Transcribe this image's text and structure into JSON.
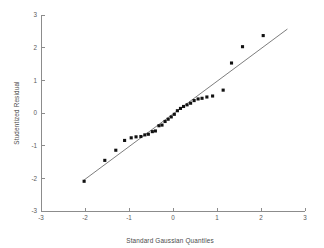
{
  "chart_data": {
    "type": "scatter",
    "title": "",
    "xlabel": "Standard Gaussian Quantiles",
    "ylabel": "Studentized Residual",
    "xlim": [
      -3,
      3
    ],
    "ylim": [
      -3,
      3
    ],
    "xticks": [
      -3,
      -2,
      -1,
      0,
      1,
      2,
      3
    ],
    "yticks": [
      -3,
      -2,
      -1,
      0,
      1,
      2,
      3
    ],
    "xtick_labels": [
      "-3",
      "-2",
      "-1",
      "0",
      "1",
      "2",
      "3"
    ],
    "ytick_labels": [
      "-3",
      "-2",
      "-1",
      "0",
      "1",
      "2",
      "3"
    ],
    "grid": false,
    "legend": "none",
    "annotations": [],
    "series": [
      {
        "name": "Studentized residuals",
        "marker": "filled-square",
        "marker_color": "#111111",
        "x": [
          -2.02,
          -1.55,
          -1.3,
          -1.1,
          -0.95,
          -0.84,
          -0.73,
          -0.64,
          -0.56,
          -0.47,
          -0.4,
          -0.32,
          -0.25,
          -0.18,
          -0.11,
          -0.04,
          0.03,
          0.1,
          0.17,
          0.24,
          0.32,
          0.4,
          0.48,
          0.57,
          0.66,
          0.77,
          0.9,
          1.14,
          1.33,
          1.58,
          2.05
        ],
        "y": [
          -2.09,
          -1.45,
          -1.14,
          -0.84,
          -0.76,
          -0.73,
          -0.72,
          -0.67,
          -0.65,
          -0.57,
          -0.55,
          -0.39,
          -0.37,
          -0.26,
          -0.19,
          -0.12,
          -0.04,
          0.07,
          0.14,
          0.2,
          0.25,
          0.3,
          0.38,
          0.43,
          0.45,
          0.49,
          0.52,
          0.7,
          1.53,
          2.03,
          2.37
        ]
      }
    ],
    "reference_line": {
      "name": "45-degree reference line",
      "slope": 1.0,
      "intercept": 0.0,
      "x_start": -2.02,
      "y_start": -2.05,
      "x_end": 2.6,
      "y_end": 2.57,
      "color": "#6e6e6e"
    },
    "colors": {
      "axis": "#8c8c8c",
      "marker": "#111111",
      "reference_line": "#6e6e6e",
      "text": "#4a4a4a",
      "background": "#ffffff"
    }
  }
}
